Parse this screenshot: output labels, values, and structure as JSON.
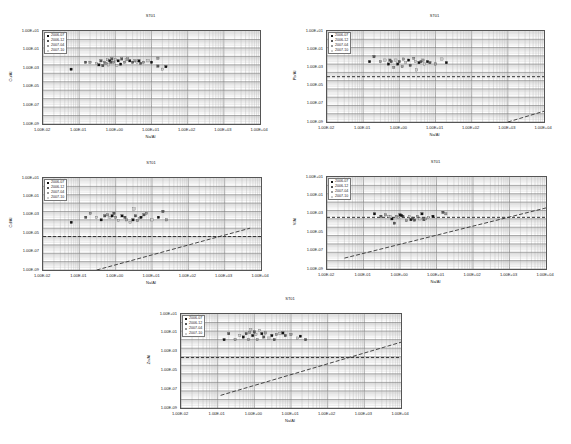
{
  "legend_items": [
    "2006-07",
    "2006-12",
    "2007-04",
    "2007-10"
  ],
  "legend_colors": [
    "#111111",
    "#555555",
    "#999999",
    "#cccccc"
  ],
  "x_ticks": [
    "1.00E-02",
    "1.00E-01",
    "1.00E+00",
    "1.00E+01",
    "1.00E+02",
    "1.00E+03",
    "1.00E+04"
  ],
  "y_ticks": [
    "1.00E+01",
    "1.00E-01",
    "1.00E-03",
    "1.00E-05",
    "1.00E-07",
    "1.00E-09"
  ],
  "chart_data": [
    {
      "type": "scatter",
      "title": "ST01",
      "xlabel": "Na/Al",
      "ylabel": "Cu/Al",
      "xscale": "log",
      "yscale": "log",
      "xlim": [
        0.01,
        10000
      ],
      "ylim": [
        1e-09,
        100
      ],
      "grid": true,
      "legend": [
        "2006-07",
        "2006-12",
        "2007-04",
        "2007-10"
      ],
      "legend_position": "upper-left",
      "box": {
        "left": 42,
        "top": 30,
        "width": 217,
        "height": 93
      },
      "hline": null,
      "trend_line": null,
      "points": [
        [
          0.06,
          0.003
        ],
        [
          0.15,
          0.02
        ],
        [
          0.2,
          0.02
        ],
        [
          0.3,
          0.015
        ],
        [
          0.35,
          0.01
        ],
        [
          0.4,
          0.03
        ],
        [
          0.5,
          0.02
        ],
        [
          0.6,
          0.04
        ],
        [
          0.7,
          0.03
        ],
        [
          0.8,
          0.05
        ],
        [
          0.9,
          0.02
        ],
        [
          1.0,
          0.04
        ],
        [
          1.2,
          0.03
        ],
        [
          1.5,
          0.05
        ],
        [
          1.8,
          0.02
        ],
        [
          2.0,
          0.04
        ],
        [
          2.5,
          0.03
        ],
        [
          3.0,
          0.02
        ],
        [
          3.5,
          0.03
        ],
        [
          4.0,
          0.02
        ],
        [
          4.5,
          0.03
        ],
        [
          5.0,
          0.015
        ],
        [
          6.0,
          0.02
        ],
        [
          8.0,
          0.03
        ],
        [
          10,
          0.02
        ],
        [
          15,
          0.007
        ],
        [
          15,
          0.06
        ],
        [
          20,
          0.003
        ],
        [
          25,
          0.006
        ],
        [
          0.45,
          0.008
        ],
        [
          0.55,
          0.015
        ],
        [
          1.1,
          0.008
        ],
        [
          1.4,
          0.012
        ],
        [
          0.75,
          0.02
        ],
        [
          2.2,
          0.05
        ],
        [
          0.65,
          0.01
        ]
      ]
    },
    {
      "type": "scatter",
      "title": "ST01",
      "xlabel": "Na/Al",
      "ylabel": "Pb/Al",
      "xscale": "log",
      "yscale": "log",
      "xlim": [
        0.01,
        10000
      ],
      "ylim": [
        1e-09,
        100
      ],
      "grid": true,
      "legend": [
        "2006-07",
        "2006-12",
        "2007-04",
        "2007-10"
      ],
      "legend_position": "upper-left",
      "box": {
        "left": 326,
        "top": 30,
        "width": 217,
        "height": 91
      },
      "hline": 0.0003,
      "trend_line": [
        [
          1000,
          1e-09
        ],
        [
          10000,
          2e-08
        ]
      ],
      "points": [
        [
          0.15,
          0.02
        ],
        [
          0.2,
          0.08
        ],
        [
          0.3,
          0.02
        ],
        [
          0.4,
          0.03
        ],
        [
          0.5,
          0.01
        ],
        [
          0.6,
          0.02
        ],
        [
          0.7,
          0.004
        ],
        [
          0.8,
          0.03
        ],
        [
          0.9,
          0.01
        ],
        [
          1.0,
          0.02
        ],
        [
          1.2,
          0.005
        ],
        [
          1.5,
          0.015
        ],
        [
          1.8,
          0.03
        ],
        [
          2.0,
          0.007
        ],
        [
          2.5,
          0.05
        ],
        [
          3.0,
          0.002
        ],
        [
          3.5,
          0.015
        ],
        [
          4.0,
          0.02
        ],
        [
          4.5,
          0.03
        ],
        [
          5.0,
          0.01
        ],
        [
          6.0,
          0.02
        ],
        [
          7.0,
          0.015
        ],
        [
          10,
          0.01
        ],
        [
          15,
          0.04
        ],
        [
          20,
          0.015
        ],
        [
          0.55,
          0.03
        ],
        [
          1.3,
          0.04
        ],
        [
          2.8,
          0.02
        ]
      ]
    },
    {
      "type": "scatter",
      "title": "ST01",
      "xlabel": "Na/Al",
      "ylabel": "Cd/Al",
      "xscale": "log",
      "yscale": "log",
      "xlim": [
        0.01,
        10000
      ],
      "ylim": [
        1e-09,
        100
      ],
      "grid": true,
      "legend": [
        "2006-07",
        "2006-12",
        "2007-04",
        "2007-10"
      ],
      "legend_position": "upper-left",
      "box": {
        "left": 42,
        "top": 177,
        "width": 218,
        "height": 92
      },
      "hline": 1e-05,
      "trend_line": [
        [
          0.3,
          1e-09
        ],
        [
          5000,
          0.0001
        ]
      ],
      "points": [
        [
          0.06,
          0.0005
        ],
        [
          0.15,
          0.002
        ],
        [
          0.2,
          0.006
        ],
        [
          0.3,
          0.002
        ],
        [
          0.4,
          0.001
        ],
        [
          0.5,
          0.003
        ],
        [
          0.6,
          0.004
        ],
        [
          0.7,
          0.002
        ],
        [
          0.8,
          0.003
        ],
        [
          0.9,
          0.006
        ],
        [
          1.0,
          0.002
        ],
        [
          1.2,
          0.0008
        ],
        [
          1.5,
          0.003
        ],
        [
          1.8,
          0.002
        ],
        [
          2.0,
          0.001
        ],
        [
          2.5,
          0.0005
        ],
        [
          3.0,
          0.001
        ],
        [
          3.5,
          0.003
        ],
        [
          4.0,
          0.0008
        ],
        [
          4.5,
          0.0015
        ],
        [
          5.0,
          0.002
        ],
        [
          6.0,
          0.004
        ],
        [
          7.0,
          0.006
        ],
        [
          10,
          0.001
        ],
        [
          15,
          0.002
        ],
        [
          20,
          0.01
        ],
        [
          25,
          0.001
        ],
        [
          3.2,
          0.02
        ]
      ]
    },
    {
      "type": "scatter",
      "title": "ST01",
      "xlabel": "Na/Al",
      "ylabel": "V/Al",
      "xscale": "log",
      "yscale": "log",
      "xlim": [
        0.01,
        10000
      ],
      "ylim": [
        1e-09,
        100
      ],
      "grid": true,
      "legend": [
        "2006-07",
        "2006-12",
        "2007-04",
        "2007-10"
      ],
      "legend_position": "upper-left",
      "box": {
        "left": 326,
        "top": 176,
        "width": 219,
        "height": 92
      },
      "hline": 0.0015,
      "trend_line": [
        [
          0.03,
          2e-08
        ],
        [
          10000,
          0.02
        ]
      ],
      "points": [
        [
          0.2,
          0.004
        ],
        [
          0.3,
          0.002
        ],
        [
          0.4,
          0.003
        ],
        [
          0.5,
          0.002
        ],
        [
          0.6,
          0.001
        ],
        [
          0.7,
          0.0003
        ],
        [
          0.8,
          0.002
        ],
        [
          0.9,
          0.0015
        ],
        [
          1.0,
          0.003
        ],
        [
          1.2,
          0.002
        ],
        [
          1.5,
          0.0006
        ],
        [
          1.8,
          0.002
        ],
        [
          2.0,
          0.0008
        ],
        [
          2.5,
          0.0007
        ],
        [
          3.0,
          0.002
        ],
        [
          3.5,
          0.001
        ],
        [
          4.0,
          0.004
        ],
        [
          4.5,
          0.0008
        ],
        [
          5.0,
          0.001
        ],
        [
          6.0,
          0.0015
        ],
        [
          8.0,
          0.002
        ],
        [
          15,
          0.006
        ],
        [
          18,
          0.004
        ],
        [
          0.55,
          0.0018
        ],
        [
          1.1,
          0.0025
        ],
        [
          2.2,
          0.0012
        ]
      ]
    },
    {
      "type": "scatter",
      "title": "ST01",
      "xlabel": "Na/Al",
      "ylabel": "Zn/Al",
      "xscale": "log",
      "yscale": "log",
      "xlim": [
        0.01,
        10000
      ],
      "ylim": [
        1e-09,
        100
      ],
      "grid": true,
      "legend": [
        "2006-07",
        "2006-12",
        "2007-04",
        "2007-10"
      ],
      "legend_position": "upper-left",
      "box": {
        "left": 180,
        "top": 313,
        "width": 220,
        "height": 94
      },
      "hline": 0.0008,
      "trend_line": [
        [
          0.12,
          3e-08
        ],
        [
          10000,
          0.05
        ]
      ],
      "points": [
        [
          0.15,
          0.1
        ],
        [
          0.2,
          0.5
        ],
        [
          0.3,
          0.1
        ],
        [
          0.4,
          0.3
        ],
        [
          0.5,
          0.2
        ],
        [
          0.6,
          0.5
        ],
        [
          0.7,
          0.1
        ],
        [
          0.8,
          1.5
        ],
        [
          0.9,
          0.3
        ],
        [
          1.0,
          0.8
        ],
        [
          1.2,
          0.1
        ],
        [
          1.4,
          1.2
        ],
        [
          1.6,
          0.5
        ],
        [
          1.8,
          0.2
        ],
        [
          2.0,
          0.6
        ],
        [
          2.5,
          0.15
        ],
        [
          3.0,
          0.3
        ],
        [
          3.5,
          0.1
        ],
        [
          4.0,
          0.4
        ],
        [
          5.0,
          0.5
        ],
        [
          6.0,
          0.6
        ],
        [
          7.0,
          0.3
        ],
        [
          10,
          0.4
        ],
        [
          15,
          0.15
        ],
        [
          18,
          0.25
        ],
        [
          25,
          0.1
        ],
        [
          0.75,
          0.7
        ],
        [
          1.1,
          0.4
        ]
      ]
    }
  ]
}
